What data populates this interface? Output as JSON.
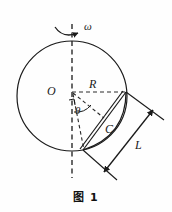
{
  "figure": {
    "caption": "图 1",
    "labels": {
      "center": "O",
      "radius": "R",
      "angle": "θ",
      "chord_region": "C",
      "length": "L",
      "angular_velocity": "ω"
    },
    "colors": {
      "stroke": "#1a1a1a",
      "dashed": "#333333",
      "background": "#fefefe",
      "text": "#1a1a1a"
    },
    "geometry": {
      "circle": {
        "cx": 72,
        "cy": 96,
        "r": 55
      },
      "axis": {
        "x": 72,
        "y_top": 24,
        "y_bottom": 178
      },
      "radius_line": {
        "x1": 72,
        "y1": 92,
        "x2": 126,
        "y2": 92
      },
      "point_top_right": {
        "x": 126,
        "y": 92
      },
      "point_bottom": {
        "x": 83,
        "y": 150
      },
      "angle_degrees": 42,
      "dimension_L": {
        "x1": 107,
        "y1": 170,
        "x2": 152,
        "y2": 112
      }
    },
    "elements": [
      "rotation-axis-dashed-line",
      "angular-velocity-arrow",
      "main-circle",
      "radius-dashed-line",
      "angle-arc",
      "right-angle-mark",
      "chord-strip",
      "lens-arc",
      "dimension-line-L"
    ]
  }
}
